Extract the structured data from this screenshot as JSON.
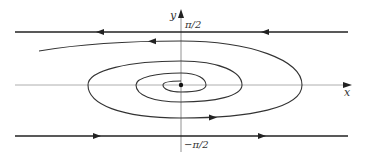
{
  "figure": {
    "type": "phase-portrait",
    "axes": {
      "x_label": "x",
      "y_label": "y",
      "y_upper_label": "π/2",
      "y_lower_label": "−π/2"
    },
    "equilibrium": {
      "x": 0,
      "y": 0,
      "label": "origin"
    },
    "trajectories": [
      {
        "name": "upper-line",
        "description": "horizontal line y = π/2, flow leftward"
      },
      {
        "name": "lower-line",
        "description": "horizontal line y = −π/2, flow rightward"
      },
      {
        "name": "spiral",
        "description": "trajectory spiraling clockwise inward to the origin from the left near y = π/2"
      }
    ],
    "colors": {
      "stroke": "#333333",
      "axis": "#888888",
      "background": "#ffffff"
    }
  }
}
